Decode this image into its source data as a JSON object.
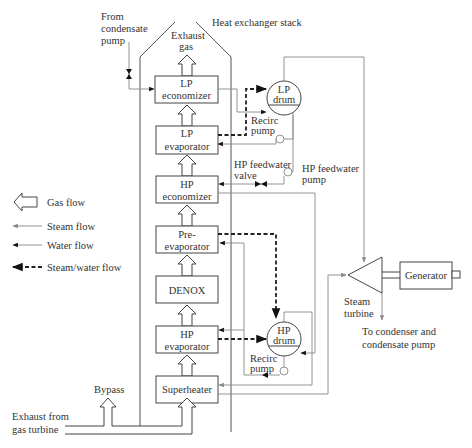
{
  "title": "Heat exchanger stack",
  "labels": {
    "from_condensate_pump": [
      "From",
      "condensate",
      "pump"
    ],
    "exhaust_gas": [
      "Exhaust",
      "gas"
    ],
    "heat_exchanger_stack": "Heat exchanger stack",
    "recirc_pump_lp": [
      "Recirc",
      "pump"
    ],
    "recirc_pump_hp": [
      "Recirc",
      "pump"
    ],
    "hp_feedwater_valve": [
      "HP feedwater",
      "valve"
    ],
    "hp_feedwater_pump": [
      "HP feedwater",
      "pump"
    ],
    "steam_turbine": [
      "Steam",
      "turbine"
    ],
    "to_condenser": [
      "To condenser and",
      "condensate pump"
    ],
    "bypass": "Bypass",
    "exhaust_from_gas_turbine": [
      "Exhaust from",
      "gas turbine"
    ]
  },
  "components": {
    "lp_economizer": [
      "LP",
      "economizer"
    ],
    "lp_evaporator": [
      "LP",
      "evaporator"
    ],
    "hp_economizer": [
      "HP",
      "economizer"
    ],
    "pre_evaporator": [
      "Pre-",
      "evaporator"
    ],
    "denox": [
      "DENOX"
    ],
    "hp_evaporator": [
      "HP",
      "evaporator"
    ],
    "superheater": [
      "Superheater"
    ],
    "lp_drum": [
      "LP",
      "drum"
    ],
    "hp_drum": [
      "HP",
      "drum"
    ],
    "generator": "Generator"
  },
  "legend": [
    {
      "icon": "gas-flow-arrow",
      "label": "Gas flow"
    },
    {
      "icon": "steam-flow-arrow",
      "label": "Steam flow",
      "color": "#888888"
    },
    {
      "icon": "water-flow-arrow",
      "label": "Water flow",
      "color": "#111111"
    },
    {
      "icon": "steam-water-flow-arrow",
      "label": "Steam/water flow",
      "color": "#111111"
    }
  ]
}
